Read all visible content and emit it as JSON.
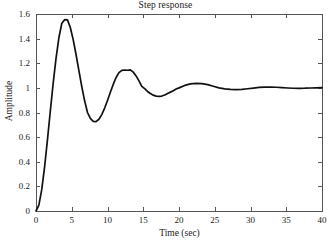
{
  "chart_data": {
    "type": "line",
    "title": "Step response",
    "xlabel": "Time (sec)",
    "ylabel": "Amplitude",
    "xlim": [
      0,
      40
    ],
    "ylim": [
      0,
      1.6
    ],
    "grid": false,
    "legend": null,
    "xticks": [
      0,
      5,
      10,
      15,
      20,
      25,
      30,
      35,
      40
    ],
    "xtick_labels": [
      "0",
      "5",
      "10",
      "15",
      "20",
      "25",
      "30",
      "35",
      "40"
    ],
    "yticks": [
      0,
      0.2,
      0.4,
      0.6,
      0.8,
      1,
      1.2,
      1.4,
      1.6
    ],
    "ytick_labels": [
      "0",
      "0.2",
      "0.4",
      "0.6",
      "0.8",
      "1",
      "1.2",
      "1.4",
      "1.6"
    ],
    "line_color": "#111111",
    "line_width": 1.7,
    "axis_color": "#555555",
    "series": [
      {
        "name": "step response",
        "x": [
          0,
          0.4,
          0.8,
          1.2,
          1.6,
          2.0,
          2.4,
          2.8,
          3.2,
          3.6,
          4.0,
          4.4,
          4.8,
          5.2,
          5.6,
          6.0,
          6.4,
          6.8,
          7.2,
          7.6,
          8.0,
          8.4,
          8.8,
          9.2,
          9.6,
          10.0,
          10.4,
          10.8,
          11.2,
          11.6,
          12.0,
          12.4,
          12.8,
          13.2,
          13.6,
          14.0,
          14.4,
          14.8,
          15.2,
          15.6,
          16.0,
          16.4,
          16.8,
          17.2,
          17.6,
          18.0,
          18.4,
          18.8,
          19.2,
          19.6,
          20.0,
          20.8,
          21.6,
          22.4,
          23.2,
          24.0,
          24.8,
          25.6,
          26.4,
          27.2,
          28.0,
          28.8,
          29.6,
          30.4,
          31.2,
          32.0,
          32.8,
          33.6,
          34.4,
          35.2,
          36.0,
          36.8,
          37.6,
          38.4,
          39.2,
          40.0
        ],
        "y": [
          0.0,
          0.047,
          0.173,
          0.357,
          0.577,
          0.81,
          1.037,
          1.24,
          1.407,
          1.522,
          1.554,
          1.552,
          1.49,
          1.392,
          1.271,
          1.14,
          1.011,
          0.895,
          0.8,
          0.752,
          0.728,
          0.726,
          0.745,
          0.783,
          0.836,
          0.898,
          0.964,
          1.028,
          1.084,
          1.124,
          1.142,
          1.145,
          1.143,
          1.146,
          1.128,
          1.097,
          1.057,
          1.012,
          0.9935,
          0.971,
          0.954,
          0.941,
          0.933,
          0.931,
          0.9335,
          0.942,
          0.955,
          0.9655,
          0.977,
          0.9905,
          1.0,
          1.02,
          1.032,
          1.037,
          1.035,
          1.026,
          1.013,
          0.9996,
          0.9925,
          0.9875,
          0.986,
          0.988,
          0.993,
          0.998,
          1.0035,
          1.0063,
          1.0068,
          1.005,
          1.0015,
          0.999,
          0.9971,
          0.9965,
          0.9972,
          0.999,
          1.0005,
          1.0014
        ]
      }
    ]
  },
  "axes_geometry": {
    "left": 36,
    "right": 322,
    "top": 14,
    "bottom": 211
  }
}
